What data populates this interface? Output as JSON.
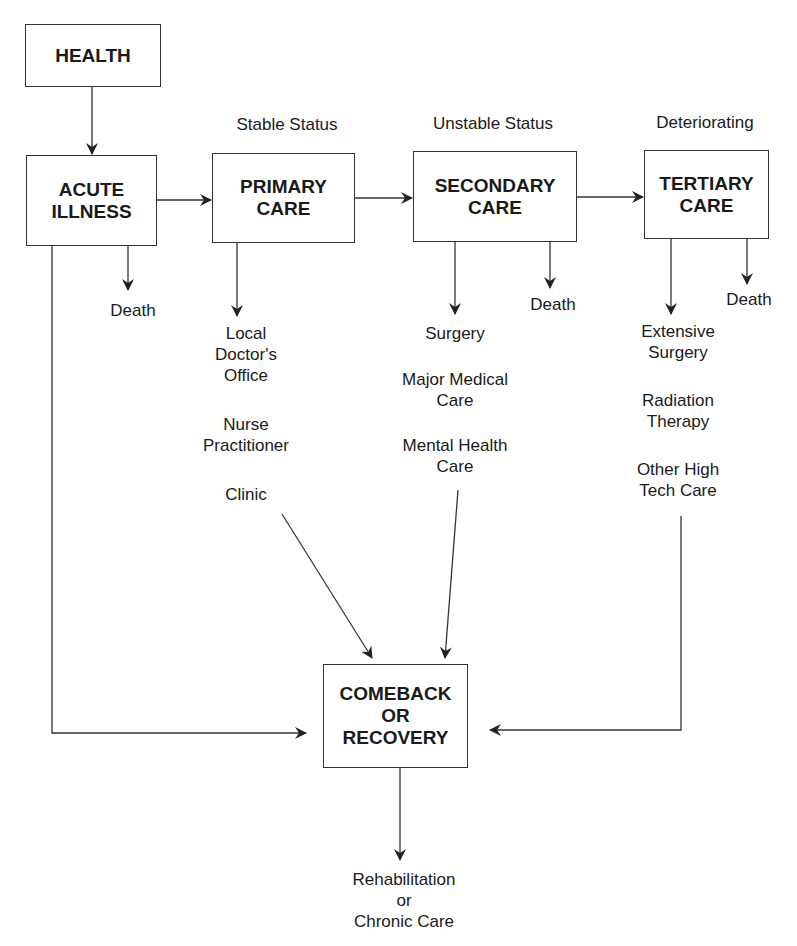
{
  "diagram": {
    "nodes": {
      "health": "HEALTH",
      "acute_illness": "ACUTE\nILLNESS",
      "primary_care": "PRIMARY\nCARE",
      "secondary_care": "SECONDARY\nCARE",
      "tertiary_care": "TERTIARY\nCARE",
      "recovery": "COMEBACK\nOR\nRECOVERY"
    },
    "status_labels": {
      "primary": "Stable Status",
      "secondary": "Unstable Status",
      "tertiary": "Deteriorating"
    },
    "outcomes": {
      "death_acute": "Death",
      "death_secondary": "Death",
      "death_tertiary": "Death"
    },
    "primary_options": [
      "Local\nDoctor's\nOffice",
      "Nurse\nPractitioner",
      "Clinic"
    ],
    "secondary_options": [
      "Surgery",
      "Major Medical\nCare",
      "Mental Health\nCare"
    ],
    "tertiary_options": [
      "Extensive\nSurgery",
      "Radiation\nTherapy",
      "Other High\nTech Care"
    ],
    "final_outcome": "Rehabilitation\nor\nChronic Care",
    "line_color": "#333333"
  }
}
